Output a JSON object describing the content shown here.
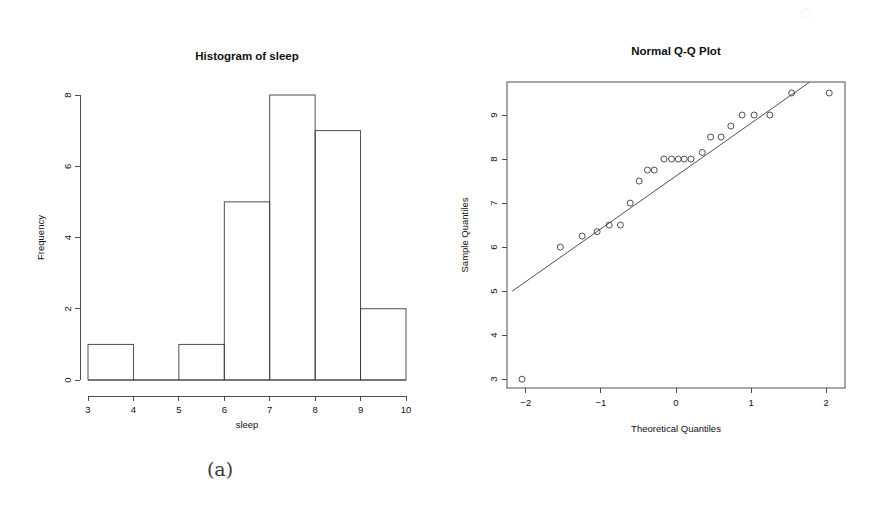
{
  "figure": {
    "background_color": "#ffffff",
    "ink_color": "#3c3c3c",
    "text_color": "#111111",
    "watermark_text": "⏲"
  },
  "panel_a": {
    "caption": "(a)",
    "chart_name": "histogram-of-sleep"
  },
  "panel_b": {
    "caption": "(b)",
    "chart_name": "normal-qq-plot"
  },
  "chart_data": [
    {
      "type": "bar",
      "id": "histogram-of-sleep",
      "title": "Histogram of sleep",
      "xlabel": "sleep",
      "ylabel": "Frequency",
      "grid": false,
      "legend": null,
      "xlim": [
        3,
        10
      ],
      "ylim": [
        0,
        8
      ],
      "xticks": [
        3,
        4,
        5,
        6,
        7,
        8,
        9,
        10
      ],
      "xtick_labels": [
        "3",
        "4",
        "5",
        "6",
        "7",
        "8",
        "9",
        "10"
      ],
      "yticks": [
        0,
        2,
        4,
        6,
        8
      ],
      "ytick_labels": [
        "0",
        "2",
        "4",
        "6",
        "8"
      ],
      "bin_edges": [
        3,
        4,
        5,
        6,
        7,
        8,
        9,
        10
      ],
      "categories": [
        "3-4",
        "4-5",
        "5-6",
        "6-7",
        "7-8",
        "8-9",
        "9-10"
      ],
      "values": [
        1,
        0,
        1,
        5,
        8,
        7,
        2
      ]
    },
    {
      "type": "scatter",
      "id": "normal-qq-plot",
      "title": "Normal Q-Q Plot",
      "xlabel": "Theoretical Quantiles",
      "ylabel": "Sample Quantiles",
      "grid": false,
      "legend": null,
      "box": true,
      "xlim": [
        -2.25,
        2.25
      ],
      "ylim": [
        2.8,
        9.75
      ],
      "xticks": [
        -2,
        -1,
        0,
        1,
        2
      ],
      "xtick_labels": [
        "−2",
        "−1",
        "0",
        "1",
        "2"
      ],
      "yticks": [
        3,
        4,
        5,
        6,
        7,
        8,
        9
      ],
      "ytick_labels": [
        "3",
        "4",
        "5",
        "6",
        "7",
        "8",
        "9"
      ],
      "points": [
        {
          "x": -2.05,
          "y": 3.0
        },
        {
          "x": -1.54,
          "y": 6.0
        },
        {
          "x": -1.25,
          "y": 6.25
        },
        {
          "x": -1.05,
          "y": 6.35
        },
        {
          "x": -0.89,
          "y": 6.5
        },
        {
          "x": -0.74,
          "y": 6.5
        },
        {
          "x": -0.61,
          "y": 7.0
        },
        {
          "x": -0.49,
          "y": 7.5
        },
        {
          "x": -0.38,
          "y": 7.75
        },
        {
          "x": -0.29,
          "y": 7.75
        },
        {
          "x": -0.16,
          "y": 8.0
        },
        {
          "x": -0.06,
          "y": 8.0
        },
        {
          "x": 0.03,
          "y": 8.0
        },
        {
          "x": 0.11,
          "y": 8.0
        },
        {
          "x": 0.2,
          "y": 8.0
        },
        {
          "x": 0.35,
          "y": 8.15
        },
        {
          "x": 0.46,
          "y": 8.5
        },
        {
          "x": 0.6,
          "y": 8.5
        },
        {
          "x": 0.73,
          "y": 8.75
        },
        {
          "x": 0.88,
          "y": 9.0
        },
        {
          "x": 1.04,
          "y": 9.0
        },
        {
          "x": 1.25,
          "y": 9.0
        },
        {
          "x": 1.54,
          "y": 9.5
        },
        {
          "x": 2.04,
          "y": 9.5
        }
      ],
      "reference_line": {
        "name": "qq-reference-line",
        "point_1": {
          "x": -2.18,
          "y": 5.0
        },
        "point_2": {
          "x": 1.78,
          "y": 9.75
        }
      }
    }
  ]
}
